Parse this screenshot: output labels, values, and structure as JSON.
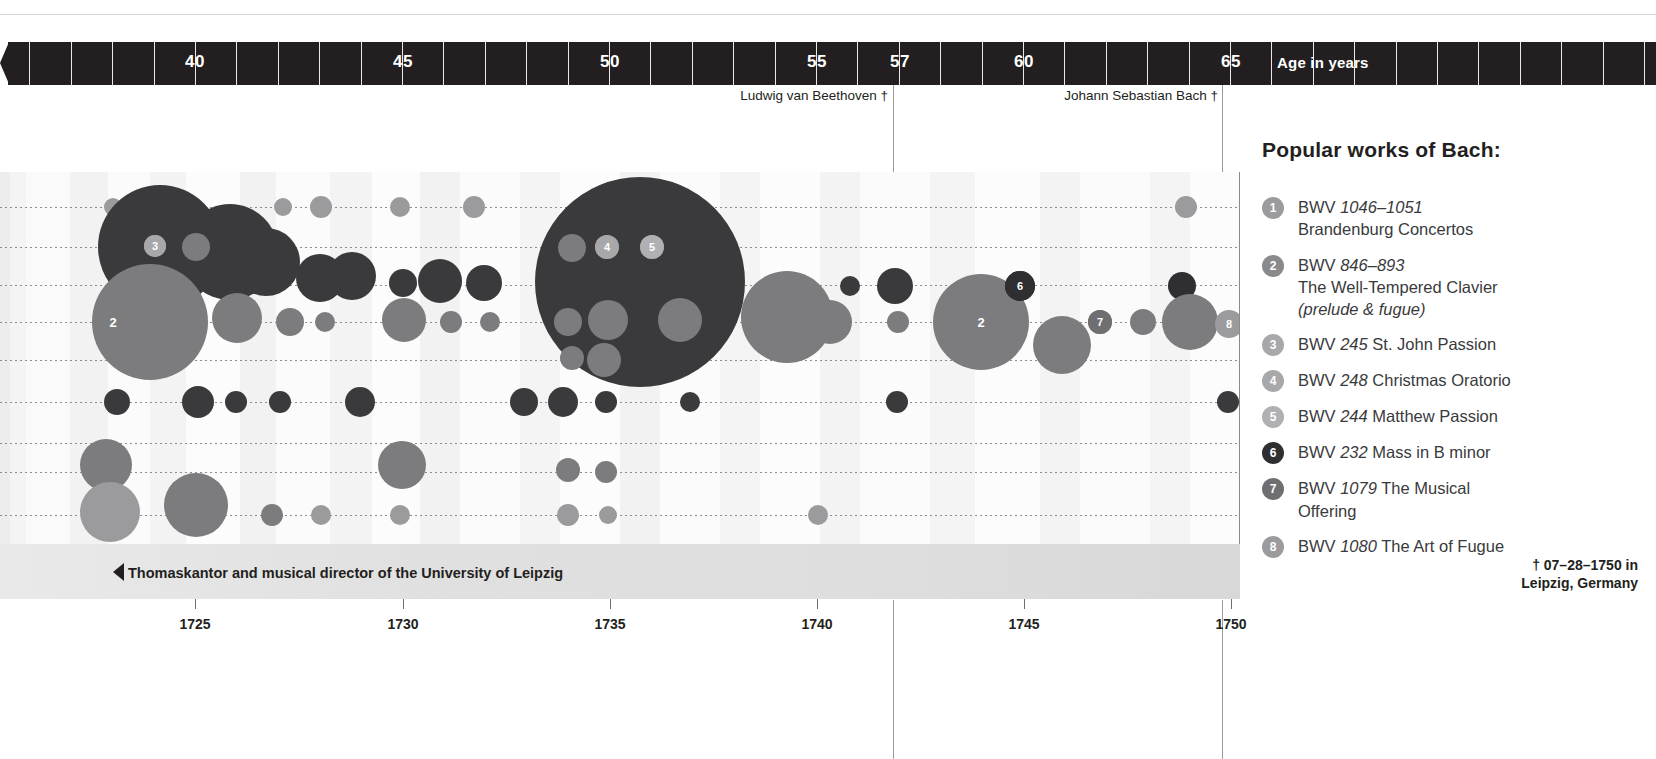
{
  "age_axis": {
    "title": "Age in years",
    "ticks": [
      {
        "label": "40",
        "x": 195
      },
      {
        "label": "45",
        "x": 403
      },
      {
        "label": "50",
        "x": 610
      },
      {
        "label": "55",
        "x": 817
      },
      {
        "label": "57",
        "x": 900
      },
      {
        "label": "60",
        "x": 1024
      },
      {
        "label": "65",
        "x": 1231
      }
    ],
    "minor_tick_spacing_px": 41.4,
    "bar_color": "#231f20",
    "text_color": "#ffffff"
  },
  "death_markers": [
    {
      "label": "Ludwig van Beethoven †",
      "x": 893,
      "label_right": 888
    },
    {
      "label": "Johann Sebastian Bach †",
      "x": 1222,
      "label_right": 1218
    }
  ],
  "year_axis": {
    "ticks": [
      {
        "label": "1725",
        "x": 195
      },
      {
        "label": "1730",
        "x": 403
      },
      {
        "label": "1735",
        "x": 610
      },
      {
        "label": "1740",
        "x": 817
      },
      {
        "label": "1745",
        "x": 1024
      },
      {
        "label": "1750",
        "x": 1231
      }
    ]
  },
  "band": {
    "role_text": "Thomaskantor and musical director of the University of Leipzig",
    "death_line1": "† 07–28–1750 in",
    "death_line2": "Leipzig, Germany"
  },
  "legend": {
    "title": "Popular works of Bach:",
    "items": [
      {
        "n": "1",
        "badge_color": "#9b9b9d",
        "bwv": "BWV",
        "num": "1046–1051",
        "line2": "Brandenburg Concertos",
        "line3": ""
      },
      {
        "n": "2",
        "badge_color": "#8a8a8c",
        "bwv": "BWV",
        "num": "846–893",
        "line2": "The Well-Tempered Clavier",
        "line3": "(prelude & fugue)"
      },
      {
        "n": "3",
        "badge_color": "#a8a8aa",
        "bwv": "BWV",
        "num": "245",
        "line2": "St. John Passion",
        "line3": "",
        "inline": true
      },
      {
        "n": "4",
        "badge_color": "#a8a8aa",
        "bwv": "BWV",
        "num": "248",
        "line2": "Christmas Oratorio",
        "line3": "",
        "inline": true
      },
      {
        "n": "5",
        "badge_color": "#b0b0b2",
        "bwv": "BWV",
        "num": "244",
        "line2": "Matthew Passion",
        "line3": "",
        "inline": true
      },
      {
        "n": "6",
        "badge_color": "#2f2f31",
        "bwv": "BWV",
        "num": "232",
        "line2": "Mass in B minor",
        "line3": "",
        "inline": true
      },
      {
        "n": "7",
        "badge_color": "#6f6f71",
        "bwv": "BWV",
        "num": "1079",
        "line2": "The Musical",
        "line3": "Offering",
        "inline": true
      },
      {
        "n": "8",
        "badge_color": "#9b9b9d",
        "bwv": "BWV",
        "num": "1080",
        "line2": "The Art of Fugue",
        "line3": "",
        "inline": true
      }
    ]
  },
  "chart_data": {
    "type": "scatter",
    "title": "Popular works of Bach:",
    "xlabel": "Age in years / Year",
    "ylabel": "",
    "grid": true,
    "xlim_years": [
      1723,
      1750
    ],
    "x_pixel_range": [
      0,
      1240
    ],
    "rows_y": [
      207,
      247,
      285,
      322,
      360,
      402,
      443,
      472,
      515
    ],
    "colors": {
      "dark": "#3a3a3c",
      "mid": "#7c7c7e",
      "light": "#9b9b9d",
      "darkest": "#2f2f31"
    },
    "bubbles": [
      {
        "x": 113,
        "y": 207,
        "r": 9,
        "c": "light"
      },
      {
        "x": 283,
        "y": 207,
        "r": 9,
        "c": "light"
      },
      {
        "x": 321,
        "y": 207,
        "r": 11,
        "c": "light"
      },
      {
        "x": 400,
        "y": 207,
        "r": 10,
        "c": "light"
      },
      {
        "x": 474,
        "y": 207,
        "r": 11,
        "c": "light"
      },
      {
        "x": 1186,
        "y": 207,
        "r": 11,
        "c": "light"
      },
      {
        "x": 160,
        "y": 247,
        "r": 62,
        "c": "dark"
      },
      {
        "x": 230,
        "y": 252,
        "r": 48,
        "c": "dark"
      },
      {
        "x": 196,
        "y": 247,
        "r": 14,
        "c": "mid"
      },
      {
        "x": 155,
        "y": 246,
        "r": 11,
        "c": "light"
      },
      {
        "x": 266,
        "y": 262,
        "r": 34,
        "c": "dark"
      },
      {
        "x": 320,
        "y": 278,
        "r": 24,
        "c": "dark"
      },
      {
        "x": 352,
        "y": 276,
        "r": 24,
        "c": "dark"
      },
      {
        "x": 403,
        "y": 283,
        "r": 14,
        "c": "dark"
      },
      {
        "x": 440,
        "y": 281,
        "r": 22,
        "c": "dark"
      },
      {
        "x": 484,
        "y": 283,
        "r": 18,
        "c": "dark"
      },
      {
        "x": 640,
        "y": 282,
        "r": 105,
        "c": "dark"
      },
      {
        "x": 572,
        "y": 248,
        "r": 14,
        "c": "mid"
      },
      {
        "x": 607,
        "y": 247,
        "r": 12,
        "c": "mid"
      },
      {
        "x": 652,
        "y": 247,
        "r": 12,
        "c": "mid"
      },
      {
        "x": 608,
        "y": 320,
        "r": 20,
        "c": "mid"
      },
      {
        "x": 680,
        "y": 320,
        "r": 22,
        "c": "mid"
      },
      {
        "x": 568,
        "y": 322,
        "r": 14,
        "c": "mid"
      },
      {
        "x": 604,
        "y": 360,
        "r": 17,
        "c": "mid"
      },
      {
        "x": 572,
        "y": 358,
        "r": 12,
        "c": "mid"
      },
      {
        "x": 150,
        "y": 322,
        "r": 58,
        "c": "mid"
      },
      {
        "x": 237,
        "y": 318,
        "r": 25,
        "c": "mid"
      },
      {
        "x": 290,
        "y": 322,
        "r": 14,
        "c": "mid"
      },
      {
        "x": 325,
        "y": 322,
        "r": 10,
        "c": "mid"
      },
      {
        "x": 404,
        "y": 320,
        "r": 22,
        "c": "mid"
      },
      {
        "x": 451,
        "y": 322,
        "r": 11,
        "c": "mid"
      },
      {
        "x": 490,
        "y": 322,
        "r": 10,
        "c": "mid"
      },
      {
        "x": 787,
        "y": 317,
        "r": 46,
        "c": "mid"
      },
      {
        "x": 830,
        "y": 322,
        "r": 22,
        "c": "mid"
      },
      {
        "x": 850,
        "y": 286,
        "r": 10,
        "c": "dark"
      },
      {
        "x": 895,
        "y": 286,
        "r": 18,
        "c": "dark"
      },
      {
        "x": 898,
        "y": 322,
        "r": 11,
        "c": "mid"
      },
      {
        "x": 981,
        "y": 322,
        "r": 48,
        "c": "mid"
      },
      {
        "x": 1020,
        "y": 286,
        "r": 15,
        "c": "darkest"
      },
      {
        "x": 1062,
        "y": 345,
        "r": 29,
        "c": "mid"
      },
      {
        "x": 1100,
        "y": 322,
        "r": 12,
        "c": "mid"
      },
      {
        "x": 1143,
        "y": 322,
        "r": 13,
        "c": "mid"
      },
      {
        "x": 1182,
        "y": 286,
        "r": 14,
        "c": "darkest"
      },
      {
        "x": 1190,
        "y": 322,
        "r": 28,
        "c": "mid"
      },
      {
        "x": 117,
        "y": 402,
        "r": 13,
        "c": "dark"
      },
      {
        "x": 198,
        "y": 402,
        "r": 16,
        "c": "dark"
      },
      {
        "x": 236,
        "y": 402,
        "r": 11,
        "c": "dark"
      },
      {
        "x": 280,
        "y": 402,
        "r": 11,
        "c": "dark"
      },
      {
        "x": 360,
        "y": 402,
        "r": 15,
        "c": "dark"
      },
      {
        "x": 524,
        "y": 402,
        "r": 14,
        "c": "dark"
      },
      {
        "x": 563,
        "y": 402,
        "r": 15,
        "c": "dark"
      },
      {
        "x": 606,
        "y": 402,
        "r": 11,
        "c": "dark"
      },
      {
        "x": 690,
        "y": 402,
        "r": 10,
        "c": "dark"
      },
      {
        "x": 897,
        "y": 402,
        "r": 11,
        "c": "dark"
      },
      {
        "x": 1228,
        "y": 402,
        "r": 11,
        "c": "dark"
      },
      {
        "x": 106,
        "y": 465,
        "r": 26,
        "c": "mid"
      },
      {
        "x": 402,
        "y": 465,
        "r": 24,
        "c": "mid"
      },
      {
        "x": 568,
        "y": 470,
        "r": 12,
        "c": "mid"
      },
      {
        "x": 606,
        "y": 472,
        "r": 11,
        "c": "mid"
      },
      {
        "x": 110,
        "y": 512,
        "r": 30,
        "c": "light"
      },
      {
        "x": 196,
        "y": 505,
        "r": 32,
        "c": "mid"
      },
      {
        "x": 272,
        "y": 515,
        "r": 11,
        "c": "mid"
      },
      {
        "x": 321,
        "y": 515,
        "r": 10,
        "c": "light"
      },
      {
        "x": 400,
        "y": 515,
        "r": 10,
        "c": "light"
      },
      {
        "x": 568,
        "y": 515,
        "r": 11,
        "c": "light"
      },
      {
        "x": 608,
        "y": 515,
        "r": 9,
        "c": "light"
      },
      {
        "x": 818,
        "y": 515,
        "r": 10,
        "c": "light"
      }
    ],
    "plot_badges": [
      {
        "n": "3",
        "x": 155,
        "y": 246,
        "color": "#a8a8aa",
        "r": 11
      },
      {
        "n": "4",
        "x": 607,
        "y": 247,
        "color": "#a8a8aa",
        "r": 12
      },
      {
        "n": "5",
        "x": 652,
        "y": 247,
        "color": "#b0b0b2",
        "r": 12
      },
      {
        "n": "6",
        "x": 1020,
        "y": 286,
        "color": "#2f2f31",
        "r": 15
      },
      {
        "n": "7",
        "x": 1100,
        "y": 322,
        "color": "#6f6f71",
        "r": 12
      },
      {
        "n": "8",
        "x": 1229,
        "y": 324,
        "color": "#9b9b9d",
        "r": 14
      }
    ],
    "plot_inline_numbers": [
      {
        "n": "2",
        "x": 113,
        "y": 322
      },
      {
        "n": "2",
        "x": 981,
        "y": 322
      }
    ]
  }
}
